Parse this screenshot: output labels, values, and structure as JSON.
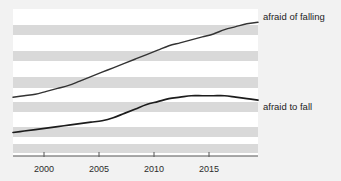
{
  "chart_data": {
    "type": "line",
    "title": "",
    "subtitle": "",
    "xlabel": "",
    "ylabel": "",
    "xlim": [
      1997,
      2019
    ],
    "ylim": [
      0,
      100
    ],
    "grid": "horizontal-banded",
    "legend_position": "right-inline",
    "x_tick_labels": [
      "2000",
      "2005",
      "2010",
      "2015"
    ],
    "x_ticks": [
      2000,
      2005,
      2010,
      2015
    ],
    "y_tick_labels": [],
    "background_bands": 6,
    "series": [
      {
        "name": "afraid of falling",
        "color": "#333333",
        "x": [
          1997,
          1998,
          1999,
          2000,
          2001,
          2002,
          2003,
          2004,
          2005,
          2006,
          2007,
          2008,
          2009,
          2010,
          2011,
          2012,
          2013,
          2014,
          2015,
          2016,
          2017,
          2018,
          2019
        ],
        "values": [
          40,
          41,
          42,
          44,
          46,
          48,
          51,
          54,
          57,
          60,
          63,
          66,
          69,
          72,
          75,
          77,
          79,
          81,
          83,
          86,
          88,
          90,
          91
        ]
      },
      {
        "name": "afraid to fall",
        "color": "#1c1c1c",
        "x": [
          1997,
          1998,
          1999,
          2000,
          2001,
          2002,
          2003,
          2004,
          2005,
          2006,
          2007,
          2008,
          2009,
          2010,
          2011,
          2012,
          2013,
          2014,
          2015,
          2016,
          2017,
          2018,
          2019
        ],
        "values": [
          16,
          17,
          18,
          19,
          20,
          21,
          22,
          23,
          24,
          26,
          29,
          32,
          35,
          37,
          39,
          40,
          41,
          41,
          41,
          41,
          40,
          39,
          38
        ]
      }
    ]
  },
  "labels": {
    "series_one": "afraid of falling",
    "series_two": "afraid to fall",
    "tick_2000": "2000",
    "tick_2005": "2005",
    "tick_2010": "2010",
    "tick_2015": "2015"
  },
  "colors": {
    "page_background": "#f2f2f2",
    "plot_background": "#ffffff",
    "band": "#d9d9d9",
    "axis": "#555555",
    "line": "#262626",
    "text": "#1c1c1c"
  }
}
